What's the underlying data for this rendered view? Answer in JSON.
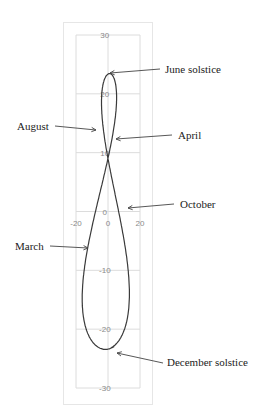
{
  "chart_data": {
    "type": "line",
    "title": "",
    "xlabel": "",
    "ylabel": "",
    "xlim": [
      -20,
      20
    ],
    "ylim": [
      -30,
      30
    ],
    "x_ticks": [
      "-20",
      "0",
      "20"
    ],
    "y_ticks": [
      "30",
      "20",
      "10",
      "0",
      "-10",
      "-20",
      "-30"
    ],
    "grid": true,
    "series": [
      {
        "name": "analemma",
        "points_note": "closed figure-eight; top ~(-1.5, 23.4), crossing ~(-1, 9), bottom ~(1, -23.4), x range ~[-14, 16]"
      }
    ],
    "annotations": [
      {
        "label": "June solstice",
        "side": "right",
        "x": -1.5,
        "y": 23.4
      },
      {
        "label": "August",
        "side": "left",
        "x": -4,
        "y": 15
      },
      {
        "label": "April",
        "side": "right",
        "x": 2,
        "y": 12
      },
      {
        "label": "October",
        "side": "right",
        "x": 11,
        "y": -2
      },
      {
        "label": "March",
        "side": "left",
        "x": -9,
        "y": -6
      },
      {
        "label": "December solstice",
        "side": "right",
        "x": 1,
        "y": -23.4
      }
    ]
  }
}
